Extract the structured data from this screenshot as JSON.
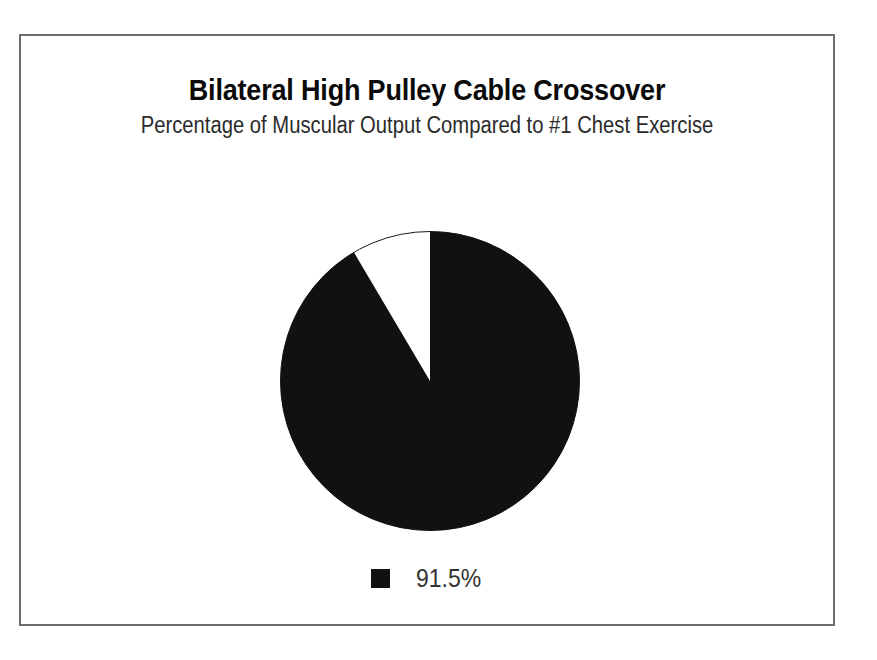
{
  "frame": {
    "border_color": "#6e6e6e"
  },
  "header": {
    "title": "Bilateral High Pulley Cable Crossover",
    "subtitle": "Percentage of Muscular Output Compared to #1 Chest Exercise"
  },
  "legend": {
    "position": "bottom",
    "entries": [
      {
        "label": "91.5%",
        "color": "#111111",
        "marker": "square"
      }
    ]
  },
  "chart_data": {
    "type": "pie",
    "title": "Bilateral High Pulley Cable Crossover",
    "subtitle": "Percentage of Muscular Output Compared to #1 Chest Exercise",
    "xlabel": "",
    "ylabel": "",
    "categories": [
      "91.5%",
      "Remainder"
    ],
    "values": [
      91.5,
      8.5
    ],
    "labels": [
      "91.5%",
      ""
    ],
    "colors": [
      "#111111",
      "#ffffff"
    ],
    "start_angle_deg": 0,
    "direction": "clockwise",
    "legend": [
      "91.5%"
    ],
    "legend_position": "bottom",
    "grid": false,
    "annotations": []
  }
}
